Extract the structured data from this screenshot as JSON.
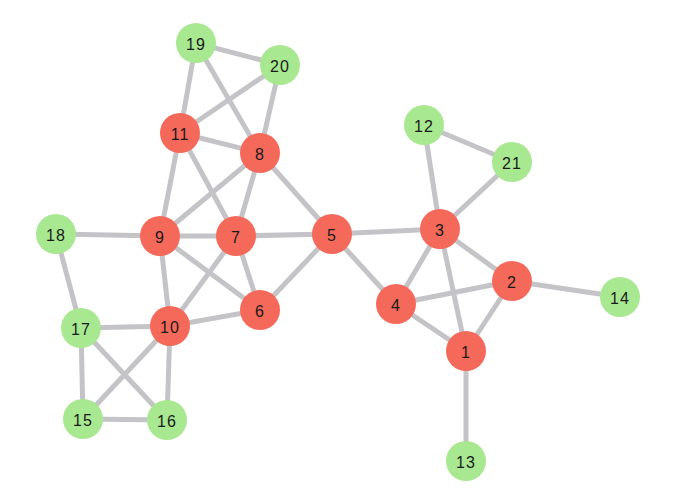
{
  "diagram": {
    "type": "network-graph",
    "colors": {
      "core": "#f5695a",
      "peripheral": "#a8e890",
      "edge": "#c4c4c8",
      "label": "#1a1a1a"
    },
    "node_radius": 20,
    "nodes": [
      {
        "id": "1",
        "label": "1",
        "group": "core",
        "x": 466,
        "y": 351
      },
      {
        "id": "2",
        "label": "2",
        "group": "core",
        "x": 512,
        "y": 281
      },
      {
        "id": "3",
        "label": "3",
        "group": "core",
        "x": 440,
        "y": 229
      },
      {
        "id": "4",
        "label": "4",
        "group": "core",
        "x": 396,
        "y": 304
      },
      {
        "id": "5",
        "label": "5",
        "group": "core",
        "x": 332,
        "y": 234
      },
      {
        "id": "6",
        "label": "6",
        "group": "core",
        "x": 260,
        "y": 310
      },
      {
        "id": "7",
        "label": "7",
        "group": "core",
        "x": 236,
        "y": 236
      },
      {
        "id": "8",
        "label": "8",
        "group": "core",
        "x": 260,
        "y": 153
      },
      {
        "id": "9",
        "label": "9",
        "group": "core",
        "x": 160,
        "y": 236
      },
      {
        "id": "10",
        "label": "10",
        "group": "core",
        "x": 170,
        "y": 326
      },
      {
        "id": "11",
        "label": "11",
        "group": "core",
        "x": 180,
        "y": 133
      },
      {
        "id": "12",
        "label": "12",
        "group": "peripheral",
        "x": 424,
        "y": 125
      },
      {
        "id": "13",
        "label": "13",
        "group": "peripheral",
        "x": 466,
        "y": 461
      },
      {
        "id": "14",
        "label": "14",
        "group": "peripheral",
        "x": 620,
        "y": 297
      },
      {
        "id": "15",
        "label": "15",
        "group": "peripheral",
        "x": 83,
        "y": 419
      },
      {
        "id": "16",
        "label": "16",
        "group": "peripheral",
        "x": 167,
        "y": 420
      },
      {
        "id": "17",
        "label": "17",
        "group": "peripheral",
        "x": 81,
        "y": 328
      },
      {
        "id": "18",
        "label": "18",
        "group": "peripheral",
        "x": 56,
        "y": 234
      },
      {
        "id": "19",
        "label": "19",
        "group": "peripheral",
        "x": 196,
        "y": 43
      },
      {
        "id": "20",
        "label": "20",
        "group": "peripheral",
        "x": 280,
        "y": 65
      },
      {
        "id": "21",
        "label": "21",
        "group": "peripheral",
        "x": 512,
        "y": 162
      }
    ],
    "edges": [
      [
        "19",
        "20"
      ],
      [
        "19",
        "11"
      ],
      [
        "19",
        "8"
      ],
      [
        "20",
        "11"
      ],
      [
        "20",
        "8"
      ],
      [
        "11",
        "8"
      ],
      [
        "11",
        "9"
      ],
      [
        "11",
        "7"
      ],
      [
        "8",
        "9"
      ],
      [
        "8",
        "7"
      ],
      [
        "8",
        "5"
      ],
      [
        "9",
        "7"
      ],
      [
        "7",
        "5"
      ],
      [
        "9",
        "6"
      ],
      [
        "9",
        "10"
      ],
      [
        "7",
        "10"
      ],
      [
        "7",
        "6"
      ],
      [
        "6",
        "5"
      ],
      [
        "10",
        "6"
      ],
      [
        "18",
        "9"
      ],
      [
        "18",
        "17"
      ],
      [
        "17",
        "10"
      ],
      [
        "17",
        "15"
      ],
      [
        "17",
        "16"
      ],
      [
        "10",
        "15"
      ],
      [
        "10",
        "16"
      ],
      [
        "15",
        "16"
      ],
      [
        "12",
        "21"
      ],
      [
        "12",
        "3"
      ],
      [
        "21",
        "3"
      ],
      [
        "5",
        "3"
      ],
      [
        "5",
        "4"
      ],
      [
        "3",
        "4"
      ],
      [
        "3",
        "2"
      ],
      [
        "3",
        "1"
      ],
      [
        "4",
        "2"
      ],
      [
        "4",
        "1"
      ],
      [
        "2",
        "1"
      ],
      [
        "2",
        "14"
      ],
      [
        "1",
        "13"
      ]
    ]
  }
}
